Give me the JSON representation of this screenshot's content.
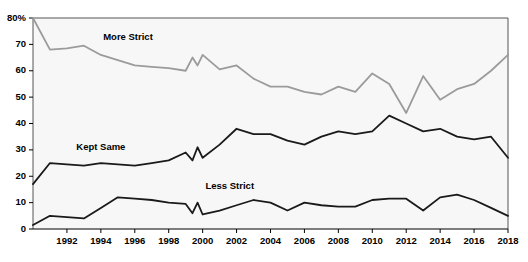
{
  "chart_data": {
    "type": "line",
    "title": "",
    "subtitle": "",
    "xlabel": "",
    "ylabel": "",
    "xlim": [
      1990,
      2018
    ],
    "ylim": [
      0,
      80
    ],
    "yticks": [
      0,
      10,
      20,
      30,
      40,
      50,
      60,
      70,
      80
    ],
    "ytick_labels": [
      "0",
      "10",
      "20",
      "30",
      "40",
      "50",
      "60",
      "70",
      "80%"
    ],
    "xticks": [
      1992,
      1994,
      1996,
      1998,
      2000,
      2002,
      2004,
      2006,
      2008,
      2010,
      2012,
      2014,
      2016,
      2018
    ],
    "xtick_labels": [
      "1992",
      "1994",
      "1996",
      "1998",
      "2000",
      "2002",
      "2004",
      "2006",
      "2008",
      "2010",
      "2012",
      "2014",
      "2016",
      "2018"
    ],
    "grid": false,
    "legend_position": "inline-annotations",
    "x": [
      1990,
      1991,
      1992,
      1993,
      1994,
      1995,
      1996,
      1997,
      1998,
      1999,
      1999.4,
      1999.7,
      2000,
      2001,
      2002,
      2003,
      2004,
      2005,
      2006,
      2007,
      2008,
      2009,
      2010,
      2011,
      2012,
      2013,
      2014,
      2015,
      2016,
      2017,
      2018
    ],
    "series": [
      {
        "name": "More Strict",
        "color": "#9b9b9b",
        "label": "More Strict",
        "label_x": 1995.6,
        "label_y": 71.5,
        "values": [
          80,
          68,
          68.5,
          69.5,
          66,
          64,
          62,
          61.5,
          61,
          60,
          65,
          62,
          66,
          60.5,
          62,
          57,
          54,
          54,
          52,
          51,
          54,
          52,
          59,
          55,
          44,
          58,
          49,
          53,
          55,
          60,
          66
        ]
      },
      {
        "name": "Kept Same",
        "color": "#1a1a1a",
        "label": "Kept Same",
        "label_x": 1994.0,
        "label_y": 30.0,
        "values": [
          17,
          25,
          24.5,
          24,
          25,
          24.5,
          24,
          25,
          26,
          29,
          26,
          31,
          27,
          32,
          38,
          36,
          36,
          33.5,
          32,
          35,
          37,
          36,
          37,
          43,
          40,
          37,
          38,
          35,
          34,
          35,
          27
        ]
      },
      {
        "name": "Less Strict",
        "color": "#1a1a1a",
        "label": "Less Strict",
        "label_x": 2001.6,
        "label_y": 15.0,
        "values": [
          1.5,
          5,
          4.5,
          4,
          8,
          12,
          11.5,
          11,
          10,
          9.5,
          6,
          10,
          5.5,
          7,
          9,
          11,
          10,
          7,
          10,
          9,
          8.5,
          8.5,
          11,
          11.5,
          11.5,
          7,
          12,
          13,
          11,
          8,
          5
        ]
      }
    ]
  }
}
